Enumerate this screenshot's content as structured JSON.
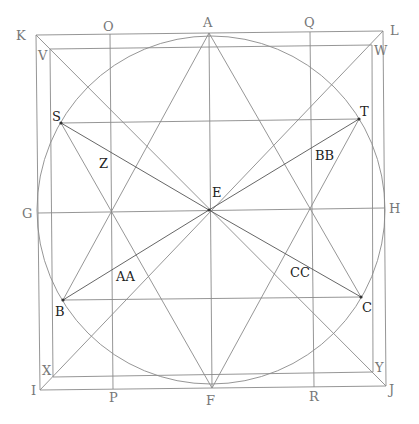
{
  "diagram": {
    "colors": {
      "line": "#8a8a8a",
      "dark_line": "#555555",
      "label": "#777777",
      "dark_label": "#222222"
    },
    "circle": {
      "cx": 211,
      "cy": 210,
      "r": 174
    },
    "points": {
      "K": [
        36,
        35
      ],
      "L": [
        383,
        31
      ],
      "I": [
        40,
        390
      ],
      "J": [
        386,
        386
      ],
      "V": [
        50,
        49
      ],
      "W": [
        372,
        45
      ],
      "X": [
        53,
        377
      ],
      "Y": [
        373,
        372
      ],
      "A": [
        209,
        33
      ],
      "F": [
        212,
        388
      ],
      "O": [
        110,
        34
      ],
      "P": [
        113,
        389
      ],
      "Q": [
        310,
        32
      ],
      "R": [
        314,
        387
      ],
      "G": [
        38,
        213
      ],
      "H": [
        384,
        208
      ],
      "E": [
        209,
        210
      ],
      "S": [
        61,
        123
      ],
      "T": [
        359,
        119
      ],
      "B": [
        63,
        300
      ],
      "C": [
        361,
        297
      ]
    },
    "labels": [
      {
        "text": "K",
        "x": 16,
        "y": 40,
        "dark": false
      },
      {
        "text": "O",
        "x": 103,
        "y": 31,
        "dark": false
      },
      {
        "text": "A",
        "x": 203,
        "y": 27,
        "dark": false
      },
      {
        "text": "Q",
        "x": 304,
        "y": 27,
        "dark": false
      },
      {
        "text": "L",
        "x": 390,
        "y": 35,
        "dark": false
      },
      {
        "text": "V",
        "x": 38,
        "y": 60,
        "dark": false
      },
      {
        "text": "W",
        "x": 374,
        "y": 55,
        "dark": false
      },
      {
        "text": "S",
        "x": 52,
        "y": 121,
        "dark": true
      },
      {
        "text": "T",
        "x": 360,
        "y": 116,
        "dark": true
      },
      {
        "text": "Z",
        "x": 99,
        "y": 168,
        "dark": true
      },
      {
        "text": "BB",
        "x": 315,
        "y": 160,
        "dark": true
      },
      {
        "text": "E",
        "x": 212,
        "y": 197,
        "dark": true
      },
      {
        "text": "G",
        "x": 22,
        "y": 218,
        "dark": false
      },
      {
        "text": "H",
        "x": 389,
        "y": 213,
        "dark": false
      },
      {
        "text": "AA",
        "x": 116,
        "y": 281,
        "dark": true
      },
      {
        "text": "CC",
        "x": 290,
        "y": 277,
        "dark": true
      },
      {
        "text": "B",
        "x": 55,
        "y": 316,
        "dark": true
      },
      {
        "text": "C",
        "x": 362,
        "y": 312,
        "dark": true
      },
      {
        "text": "X",
        "x": 42,
        "y": 375,
        "dark": false
      },
      {
        "text": "Y",
        "x": 375,
        "y": 372,
        "dark": false
      },
      {
        "text": "I",
        "x": 31,
        "y": 395,
        "dark": false
      },
      {
        "text": "J",
        "x": 389,
        "y": 394,
        "dark": false
      },
      {
        "text": "P",
        "x": 109,
        "y": 402,
        "dark": false
      },
      {
        "text": "F",
        "x": 206,
        "y": 405,
        "dark": false
      },
      {
        "text": "R",
        "x": 309,
        "y": 401,
        "dark": false
      }
    ],
    "segments": [
      [
        "K",
        "L"
      ],
      [
        "L",
        "J"
      ],
      [
        "J",
        "I"
      ],
      [
        "I",
        "K"
      ],
      [
        "V",
        "W"
      ],
      [
        "W",
        "Y"
      ],
      [
        "Y",
        "X"
      ],
      [
        "X",
        "V"
      ],
      [
        "K",
        "J"
      ],
      [
        "I",
        "L"
      ],
      [
        "O",
        "P"
      ],
      [
        "Q",
        "R"
      ],
      [
        "A",
        "F"
      ],
      [
        "G",
        "H"
      ],
      [
        "A",
        "B"
      ],
      [
        "A",
        "C"
      ],
      [
        "F",
        "S"
      ],
      [
        "F",
        "T"
      ],
      [
        "S",
        "T"
      ],
      [
        "B",
        "C"
      ]
    ],
    "dark_segments": [
      [
        "S",
        "E"
      ],
      [
        "T",
        "E"
      ],
      [
        "B",
        "E"
      ],
      [
        "C",
        "E"
      ]
    ],
    "vertices": [
      "S",
      "T",
      "B",
      "C",
      "E"
    ]
  }
}
